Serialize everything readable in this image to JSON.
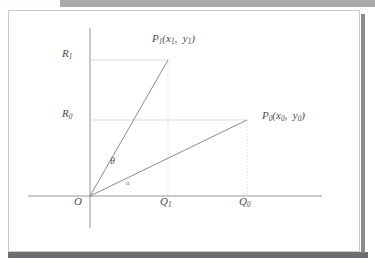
{
  "document": {
    "type": "scanned-figure",
    "background_color": "#ffffff",
    "panel_border_color": "#c9c9cc",
    "scan_bar_top_color": "#a9a9ab",
    "scan_bar_bottom_color": "#6e6e72"
  },
  "figure": {
    "axis_color": "#8a8a8a",
    "ray_color": "#7d7d85",
    "guide_color": "#cfcfd4",
    "label_color": "#4a4a4a",
    "origin_label": "O",
    "x_axis": {
      "label": "",
      "start_x": 90,
      "end_x": 322,
      "y": 196
    },
    "y_axis": {
      "label": "",
      "x": 90,
      "top_y": 28,
      "bottom_y": 228
    },
    "points": [
      {
        "name": "P1",
        "label_base": "P",
        "label_sub": "1",
        "coord_text_x": "x",
        "coord_sub_x": "1",
        "coord_text_y": "y",
        "coord_sub_y": "1",
        "full_label": "P1(x1, y1)",
        "px": 168,
        "py": 60
      },
      {
        "name": "P0",
        "label_base": "P",
        "label_sub": "0",
        "coord_text_x": "x",
        "coord_sub_x": "0",
        "coord_text_y": "y",
        "coord_sub_y": "0",
        "full_label": "P0(x0, y0)",
        "px": 247,
        "py": 120
      }
    ],
    "y_ticks": [
      {
        "label_base": "R",
        "label_sub": "1",
        "full_label": "R1",
        "y": 60
      },
      {
        "label_base": "R",
        "label_sub": "0",
        "full_label": "R0",
        "y": 120
      }
    ],
    "x_ticks": [
      {
        "label_base": "Q",
        "label_sub": "1",
        "full_label": "Q1",
        "x": 168
      },
      {
        "label_base": "Q",
        "label_sub": "0",
        "full_label": "Q0",
        "x": 247
      }
    ],
    "angles": [
      {
        "name": "theta",
        "symbol": "θ",
        "between": "OP1 and OP0"
      },
      {
        "name": "alpha",
        "symbol": "α",
        "between": "OP0 and x-axis"
      }
    ]
  }
}
